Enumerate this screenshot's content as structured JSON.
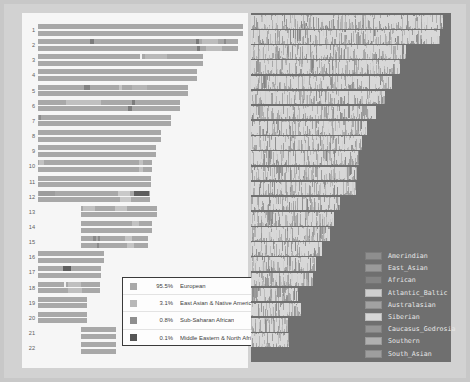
{
  "chart_data": {
    "type": "bar",
    "title": "",
    "xlabel": "",
    "ylabel": "Chromosome",
    "grid": false,
    "legend_position": "inset-bottom-left / right-panel-bottom-right",
    "categories": [
      "1",
      "2",
      "3",
      "4",
      "5",
      "6",
      "7",
      "8",
      "9",
      "10",
      "11",
      "12",
      "13",
      "14",
      "15",
      "16",
      "17",
      "18",
      "19",
      "20",
      "21",
      "22"
    ],
    "ancestry_summary": {
      "type": "pie",
      "labels": [
        "European",
        "East Asian & Native American",
        "Sub-Saharan African",
        "Middle Eastern & North African"
      ],
      "values": [
        95.5,
        3.1,
        0.8,
        0.1
      ],
      "unit": "%"
    },
    "components": {
      "labels": [
        "Amerindian",
        "East_Asian",
        "African",
        "Atlantic_Baltic",
        "Australasian",
        "Siberian",
        "Caucasus_Gedrosia",
        "Southern",
        "South_Asian"
      ]
    }
  },
  "left_panel": {
    "name": "chromosome-ancestry-plot",
    "rows": [
      {
        "label": "1",
        "indent": 0,
        "width": 100,
        "segments": []
      },
      {
        "label": "2",
        "indent": 0,
        "width": 97.5,
        "segments": [
          {
            "left": 26,
            "width": 2.0,
            "color": "#7d7d7d"
          },
          {
            "left": 79,
            "width": 1.6,
            "color": "#7a7a7a"
          },
          {
            "left": 82,
            "width": 8.0,
            "color": "#bdbdbd"
          },
          {
            "left": 93,
            "width": 1.3,
            "color": "#8c8c8c"
          }
        ]
      },
      {
        "label": "3",
        "indent": 0,
        "width": 80.5,
        "segments": [
          {
            "left": 62,
            "width": 1.2,
            "color": "#f2f2f2"
          },
          {
            "left": 65,
            "width": 13.0,
            "color": "#b9b9b9"
          }
        ]
      },
      {
        "label": "4",
        "indent": 0,
        "width": 77.5,
        "segments": []
      },
      {
        "label": "5",
        "indent": 0,
        "width": 73.0,
        "segments": [
          {
            "left": 31,
            "width": 4.0,
            "color": "#828282"
          },
          {
            "left": 54,
            "width": 2.0,
            "color": "#c4c4c4"
          },
          {
            "left": 63,
            "width": 10.0,
            "color": "#b5b5b5"
          }
        ]
      },
      {
        "label": "6",
        "indent": 0,
        "width": 69.5,
        "segments": [
          {
            "left": 20,
            "width": 24.0,
            "color": "#c0c0c0"
          },
          {
            "left": 66,
            "width": 2.4,
            "color": "#7c7c7c"
          }
        ]
      },
      {
        "label": "7",
        "indent": 0,
        "width": 65.0,
        "segments": [
          {
            "left": 1,
            "width": 1.4,
            "color": "#8e8e8e"
          }
        ]
      },
      {
        "label": "8",
        "indent": 0,
        "width": 60.0,
        "segments": []
      },
      {
        "label": "9",
        "indent": 0,
        "width": 57.5,
        "segments": []
      },
      {
        "label": "10",
        "indent": 0,
        "width": 55.5,
        "segments": [
          {
            "left": 1,
            "width": 4.0,
            "color": "#c2c2c2"
          },
          {
            "left": 89,
            "width": 3.0,
            "color": "#c2c2c2"
          }
        ]
      },
      {
        "label": "11",
        "indent": 0,
        "width": 55.0,
        "segments": []
      },
      {
        "label": "12",
        "indent": 0,
        "width": 54.5,
        "segments": [
          {
            "left": 1,
            "width": 14.0,
            "color": "#9c9c9c"
          },
          {
            "left": 72,
            "width": 10.0,
            "color": "#c9c9c9"
          },
          {
            "left": 86,
            "width": 13.0,
            "color": "#5e5e5e"
          }
        ]
      },
      {
        "label": "13",
        "indent": 21,
        "width": 37.0,
        "segments": [
          {
            "left": 3,
            "width": 16.0,
            "color": "#c0c0c0"
          },
          {
            "left": 45,
            "width": 16.0,
            "color": "#c4c4c4"
          }
        ]
      },
      {
        "label": "14",
        "indent": 21,
        "width": 34.5,
        "segments": [
          {
            "left": 72,
            "width": 10.0,
            "color": "#c2c2c2"
          }
        ]
      },
      {
        "label": "15",
        "indent": 21,
        "width": 32.5,
        "segments": [
          {
            "left": 18,
            "width": 5.0,
            "color": "#8a8a8a"
          },
          {
            "left": 26,
            "width": 3.0,
            "color": "#8a8a8a"
          },
          {
            "left": 66,
            "width": 11.0,
            "color": "#c4c4c4"
          }
        ]
      },
      {
        "label": "16",
        "indent": 0,
        "width": 32.0,
        "segments": []
      },
      {
        "label": "17",
        "indent": 0,
        "width": 30.5,
        "segments": [
          {
            "left": 40,
            "width": 12.0,
            "color": "#5f5f5f"
          }
        ]
      },
      {
        "label": "18",
        "indent": 0,
        "width": 30.0,
        "segments": [
          {
            "left": 43,
            "width": 3.0,
            "color": "#f0f0f0"
          },
          {
            "left": 48,
            "width": 22.0,
            "color": "#bfbfbf"
          }
        ]
      },
      {
        "label": "19",
        "indent": 0,
        "width": 24.0,
        "segments": []
      },
      {
        "label": "20",
        "indent": 0,
        "width": 24.0,
        "segments": []
      },
      {
        "label": "21",
        "indent": 21,
        "width": 17.0,
        "segments": []
      },
      {
        "label": "22",
        "indent": 21,
        "width": 17.0,
        "segments": []
      }
    ]
  },
  "ancestry_legend": {
    "name": "ancestry-legend",
    "items": [
      {
        "pct": "95.5%",
        "label": "European",
        "color": "#a9a9a9"
      },
      {
        "pct": "3.1%",
        "label": "East Asian & Native American",
        "color": "#b8b8b8"
      },
      {
        "pct": "0.8%",
        "label": "Sub-Saharan African",
        "color": "#8f8f8f"
      },
      {
        "pct": "0.1%",
        "label": "Middle Eastern & North African",
        "color": "#555555"
      }
    ]
  },
  "right_panel": {
    "name": "chromosome-painting-plot",
    "background": "#6f6f6f",
    "rows": [
      {
        "chrom": "1",
        "width": 98.0
      },
      {
        "chrom": "2",
        "width": 96.5
      },
      {
        "chrom": "3",
        "width": 79.0
      },
      {
        "chrom": "4",
        "width": 76.0
      },
      {
        "chrom": "5",
        "width": 72.0
      },
      {
        "chrom": "6",
        "width": 68.5
      },
      {
        "chrom": "7",
        "width": 64.0
      },
      {
        "chrom": "8",
        "width": 59.0
      },
      {
        "chrom": "9",
        "width": 56.5
      },
      {
        "chrom": "10",
        "width": 55.0
      },
      {
        "chrom": "11",
        "width": 54.0
      },
      {
        "chrom": "12",
        "width": 53.5
      },
      {
        "chrom": "13",
        "width": 45.5
      },
      {
        "chrom": "14",
        "width": 42.5
      },
      {
        "chrom": "15",
        "width": 40.5
      },
      {
        "chrom": "16",
        "width": 36.0
      },
      {
        "chrom": "17",
        "width": 33.0
      },
      {
        "chrom": "18",
        "width": 31.5
      },
      {
        "chrom": "19",
        "width": 24.0
      },
      {
        "chrom": "20",
        "width": 25.5
      },
      {
        "chrom": "21",
        "width": 19.0
      },
      {
        "chrom": "22",
        "width": 19.5
      }
    ]
  },
  "pop_legend": {
    "name": "population-component-legend",
    "items": [
      {
        "label": "Amerindian",
        "color": "#8e8e8e"
      },
      {
        "label": "East_Asian",
        "color": "#9a9a9a"
      },
      {
        "label": "African",
        "color": "#848484"
      },
      {
        "label": "Atlantic_Baltic",
        "color": "#cfcfcf"
      },
      {
        "label": "Australasian",
        "color": "#a2a2a2"
      },
      {
        "label": "Siberian",
        "color": "#d6d6d6"
      },
      {
        "label": "Caucasus_Gedrosia",
        "color": "#959595"
      },
      {
        "label": "Southern",
        "color": "#b0b0b0"
      },
      {
        "label": "South_Asian",
        "color": "#9e9e9e"
      }
    ]
  }
}
